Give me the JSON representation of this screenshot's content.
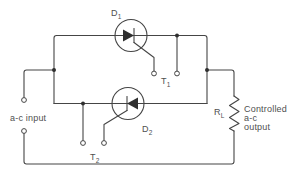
{
  "diagram": {
    "type": "circuit-schematic",
    "colors": {
      "line": "#454545",
      "text": "#4f4f4f",
      "background": "#ffffff"
    },
    "labels": {
      "d1_base": "D",
      "d1_sub": "1",
      "d2_base": "D",
      "d2_sub": "2",
      "t1_base": "T",
      "t1_sub": "1",
      "t2_base": "T",
      "t2_sub": "2",
      "rl_base": "R",
      "rl_sub": "L",
      "ac_input": "a-c input",
      "output_line1": "Controlled",
      "output_line2": "a-c",
      "output_line3": "output"
    }
  }
}
